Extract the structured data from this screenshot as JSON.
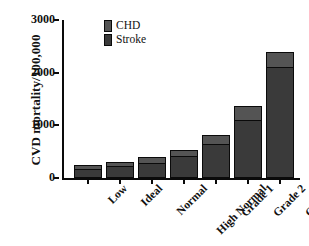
{
  "chart_data": {
    "type": "bar",
    "subtype": "stacked-bar",
    "title": "",
    "xlabel": "",
    "ylabel": "CVD mortality/100,000",
    "ylim": [
      0,
      3000
    ],
    "yticks": [
      0,
      1000,
      2000,
      3000
    ],
    "ytick_labels": [
      "0",
      "1000",
      "2000",
      "3000"
    ],
    "grid": false,
    "legend_position": "top-left-inside",
    "categories": [
      "Low",
      "Ideal",
      "Normal",
      "High Normal",
      "Grade 1",
      "Grade 2",
      "Grade 3"
    ],
    "series": [
      {
        "name": "Stroke",
        "color": "#3a3a3a",
        "values": [
          170,
          230,
          290,
          410,
          650,
          1100,
          2100
        ]
      },
      {
        "name": "CHD",
        "color": "#545454",
        "values": [
          80,
          80,
          100,
          120,
          170,
          270,
          300
        ]
      }
    ],
    "totals": [
      250,
      310,
      390,
      530,
      820,
      1370,
      2400
    ],
    "stack_order_bottom_to_top": [
      "Stroke",
      "CHD"
    ]
  },
  "legend": {
    "items": [
      {
        "label": "CHD",
        "color": "#545454"
      },
      {
        "label": "Stroke",
        "color": "#3a3a3a"
      }
    ]
  },
  "axes": {
    "y_title": "CVD mortality/100,000",
    "y_tick_labels": [
      "3000",
      "2000",
      "1000",
      "0"
    ],
    "x_tick_labels": [
      "Low",
      "Ideal",
      "Normal",
      "High Normal",
      "Grade 1",
      "Grade 2",
      "Grade 3"
    ]
  },
  "colors": {
    "axis": "#0a0a0a",
    "background": "#ffffff",
    "chd": "#545454",
    "stroke": "#3a3a3a"
  }
}
